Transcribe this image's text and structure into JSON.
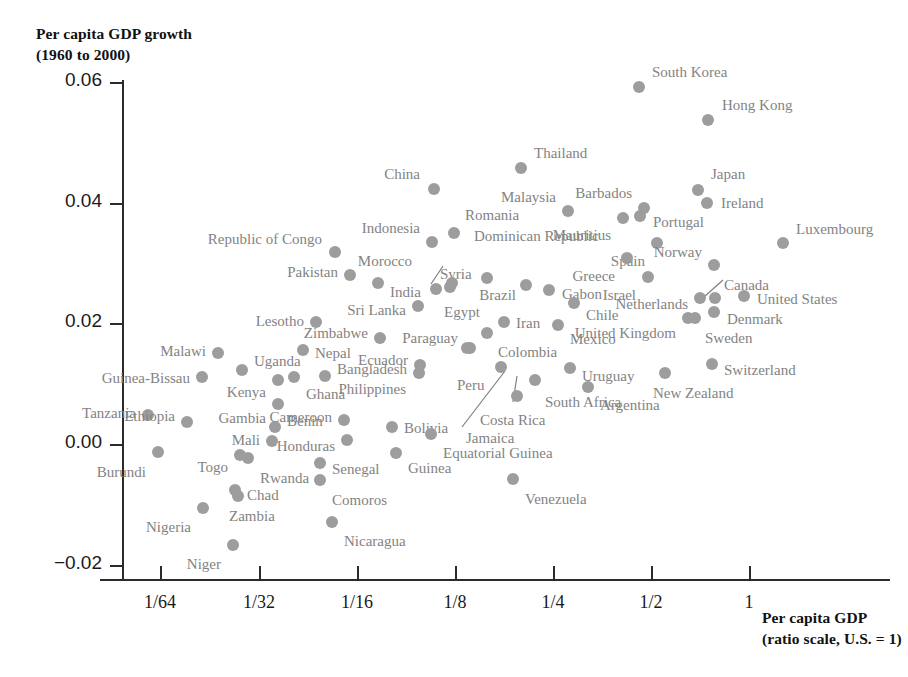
{
  "chart_data": {
    "type": "scatter",
    "title": "",
    "ylabel": "Per capita GDP growth\n(1960 to 2000)",
    "ylabel_line1": "Per capita GDP growth",
    "ylabel_line2": "(1960 to 2000)",
    "xlabel": "Per capita GDP\n(ratio scale, U.S. = 1)",
    "xlabel_line1": "Per capita GDP",
    "xlabel_line2": "(ratio scale, U.S. = 1)",
    "xscale": "log2",
    "grid": false,
    "legend": false,
    "point_color": "#9d9d9d",
    "label_color": "#838383",
    "yticks": [
      "0.06",
      "0.04",
      "0.02",
      "0.00",
      "−0.02"
    ],
    "ytick_values": [
      0.06,
      0.04,
      0.02,
      0.0,
      -0.02
    ],
    "xticks": [
      "1/64",
      "1/32",
      "1/16",
      "1/8",
      "1/4",
      "1/2",
      "1"
    ],
    "xtick_values": [
      0.015625,
      0.03125,
      0.0625,
      0.125,
      0.25,
      0.5,
      1
    ],
    "ylim": [
      -0.02,
      0.06
    ],
    "xlim_ratio": [
      0.0098,
      1.7
    ],
    "points": [
      {
        "name": "South Korea",
        "x": 0.215,
        "y": 0.0589,
        "px": 639,
        "py": 87,
        "lx": 652,
        "ly": 64,
        "align": "left"
      },
      {
        "name": "Hong Kong",
        "x": 0.425,
        "y": 0.0535,
        "px": 708,
        "py": 120,
        "lx": 722,
        "ly": 97,
        "align": "left"
      },
      {
        "name": "Thailand",
        "x": 0.119,
        "y": 0.0455,
        "px": 521,
        "py": 168,
        "lx": 534,
        "ly": 145,
        "align": "left"
      },
      {
        "name": "Japan",
        "x": 0.385,
        "y": 0.0418,
        "px": 698,
        "py": 190,
        "lx": 711,
        "ly": 166,
        "align": "left"
      },
      {
        "name": "China",
        "x": 0.0525,
        "y": 0.0421,
        "px": 434,
        "py": 189,
        "lx": 420,
        "ly": 166,
        "align": "right"
      },
      {
        "name": "Barbados",
        "x": 0.219,
        "y": 0.0392,
        "px": 644,
        "py": 208,
        "lx": 632,
        "ly": 185,
        "align": "right"
      },
      {
        "name": "Ireland",
        "x": 0.407,
        "y": 0.0396,
        "px": 707,
        "py": 203,
        "lx": 721,
        "ly": 195,
        "align": "left"
      },
      {
        "name": "Malaysia",
        "x": 0.152,
        "y": 0.0385,
        "px": 568,
        "py": 211,
        "lx": 556,
        "ly": 189,
        "align": "right"
      },
      {
        "name": "Portugal",
        "x": 0.213,
        "y": 0.0374,
        "px": 640,
        "py": 216,
        "lx": 653,
        "ly": 214,
        "align": "left"
      },
      {
        "name": "Mauritius",
        "x": 0.186,
        "y": 0.0368,
        "px": 623,
        "py": 218,
        "lx": 611,
        "ly": 227,
        "align": "right"
      },
      {
        "name": "Romania",
        "x": 0.0625,
        "y": 0.0347,
        "px": 454,
        "py": 233,
        "lx": 465,
        "ly": 207,
        "align": "left"
      },
      {
        "name": "Indonesia",
        "x": 0.0506,
        "y": 0.0333,
        "px": 432,
        "py": 242,
        "lx": 420,
        "ly": 220,
        "align": "right"
      },
      {
        "name": "Republic of Congo",
        "x": 0.0212,
        "y": 0.0318,
        "px": 335,
        "py": 252,
        "lx": 322,
        "ly": 231,
        "align": "right"
      },
      {
        "name": "Luxembourg",
        "x": 1.22,
        "y": 0.0327,
        "px": 783,
        "py": 243,
        "lx": 796,
        "ly": 221,
        "align": "left"
      },
      {
        "name": "Spain",
        "x": 0.256,
        "y": 0.0328,
        "px": 657,
        "py": 243,
        "lx": 645,
        "ly": 253,
        "align": "right"
      },
      {
        "name": "Dominican Republic",
        "x": 0.0788,
        "y": 0.0297,
        "px": 487,
        "py": 278,
        "lx": 474,
        "ly": 228,
        "align": "left"
      },
      {
        "name": "Greece",
        "x": 0.192,
        "y": 0.0284,
        "px": 627,
        "py": 258,
        "lx": 615,
        "ly": 268,
        "align": "right"
      },
      {
        "name": "Norway",
        "x": 0.423,
        "y": 0.0292,
        "px": 714,
        "py": 265,
        "lx": 702,
        "ly": 244,
        "align": "right"
      },
      {
        "name": "Pakistan",
        "x": 0.0245,
        "y": 0.0287,
        "px": 350,
        "py": 275,
        "lx": 338,
        "ly": 264,
        "align": "right"
      },
      {
        "name": "Syria",
        "x": 0.0598,
        "y": 0.0275,
        "px": 450,
        "py": 287,
        "lx": 440,
        "ly": 266,
        "align": "left"
      },
      {
        "name": "Morocco",
        "x": 0.0545,
        "y": 0.0272,
        "px": 436,
        "py": 289,
        "lx": 412,
        "ly": 253,
        "align": "right"
      },
      {
        "name": "Israel",
        "x": 0.239,
        "y": 0.0281,
        "px": 648,
        "py": 277,
        "lx": 636,
        "ly": 287,
        "align": "right"
      },
      {
        "name": "India",
        "x": 0.0312,
        "y": 0.0275,
        "px": 378,
        "py": 283,
        "lx": 390,
        "ly": 284,
        "align": "left"
      },
      {
        "name": "Egypt",
        "x": 0.0645,
        "y": 0.0273,
        "px": 452,
        "py": 283,
        "lx": 444,
        "ly": 304,
        "align": "left"
      },
      {
        "name": "Brazil",
        "x": 0.105,
        "y": 0.0268,
        "px": 526,
        "py": 285,
        "lx": 516,
        "ly": 287,
        "align": "right"
      },
      {
        "name": "Gabon",
        "x": 0.131,
        "y": 0.0259,
        "px": 549,
        "py": 290,
        "lx": 562,
        "ly": 286,
        "align": "left"
      },
      {
        "name": "Canada",
        "x": 0.425,
        "y": 0.0247,
        "px": 715,
        "py": 298,
        "lx": 724,
        "ly": 277,
        "align": "left"
      },
      {
        "name": "United States",
        "x": 0.62,
        "y": 0.0249,
        "px": 744,
        "py": 296,
        "lx": 757,
        "ly": 291,
        "align": "left"
      },
      {
        "name": "Netherlands",
        "x": 0.398,
        "y": 0.0247,
        "px": 700,
        "py": 298,
        "lx": 688,
        "ly": 296,
        "align": "right"
      },
      {
        "name": "Sri Lanka",
        "x": 0.0455,
        "y": 0.0238,
        "px": 418,
        "py": 306,
        "lx": 406,
        "ly": 302,
        "align": "right"
      },
      {
        "name": "Chile",
        "x": 0.149,
        "y": 0.0243,
        "px": 574,
        "py": 303,
        "lx": 586,
        "ly": 307,
        "align": "left"
      },
      {
        "name": "Denmark",
        "x": 0.422,
        "y": 0.0224,
        "px": 714,
        "py": 312,
        "lx": 727,
        "ly": 311,
        "align": "left"
      },
      {
        "name": "Sweden",
        "x": 0.382,
        "y": 0.0222,
        "px": 695,
        "py": 318,
        "lx": 705,
        "ly": 330,
        "align": "left"
      },
      {
        "name": "United Kingdom",
        "x": 0.372,
        "y": 0.0222,
        "px": 688,
        "py": 318,
        "lx": 676,
        "ly": 325,
        "align": "right"
      },
      {
        "name": "Iran",
        "x": 0.0905,
        "y": 0.0221,
        "px": 504,
        "py": 322,
        "lx": 516,
        "ly": 315,
        "align": "left"
      },
      {
        "name": "Lesotho",
        "x": 0.0168,
        "y": 0.0219,
        "px": 316,
        "py": 322,
        "lx": 304,
        "ly": 313,
        "align": "right"
      },
      {
        "name": "Mexico",
        "x": 0.137,
        "y": 0.0217,
        "px": 558,
        "py": 325,
        "lx": 570,
        "ly": 331,
        "align": "left"
      },
      {
        "name": "Zimbabwe",
        "x": 0.0319,
        "y": 0.0203,
        "px": 380,
        "py": 338,
        "lx": 368,
        "ly": 325,
        "align": "right"
      },
      {
        "name": "Colombia",
        "x": 0.0818,
        "y": 0.0202,
        "px": 487,
        "py": 333,
        "lx": 498,
        "ly": 344,
        "align": "left"
      },
      {
        "name": "Paraguay",
        "x": 0.0715,
        "y": 0.0193,
        "px": 470,
        "py": 348,
        "lx": 458,
        "ly": 330,
        "align": "right"
      },
      {
        "name": "Nepal",
        "x": 0.0131,
        "y": 0.0185,
        "px": 303,
        "py": 350,
        "lx": 315,
        "ly": 345,
        "align": "left"
      },
      {
        "name": "Uganda",
        "x": 0.00793,
        "y": 0.0164,
        "px": 242,
        "py": 370,
        "lx": 254,
        "ly": 353,
        "align": "left"
      },
      {
        "name": "Malawi",
        "x": 0.00648,
        "y": 0.0167,
        "px": 218,
        "py": 353,
        "lx": 206,
        "ly": 343,
        "align": "right"
      },
      {
        "name": "Ecuador",
        "x": 0.0506,
        "y": 0.0174,
        "px": 420,
        "py": 365,
        "lx": 408,
        "ly": 352,
        "align": "right"
      },
      {
        "name": "Uruguay",
        "x": 0.143,
        "y": 0.0162,
        "px": 570,
        "py": 368,
        "lx": 582,
        "ly": 368,
        "align": "left"
      },
      {
        "name": "Switzerland",
        "x": 0.42,
        "y": 0.0163,
        "px": 712,
        "py": 364,
        "lx": 724,
        "ly": 362,
        "align": "left"
      },
      {
        "name": "New Zealand",
        "x": 0.272,
        "y": 0.0158,
        "px": 665,
        "py": 373,
        "lx": 653,
        "ly": 385,
        "align": "left"
      },
      {
        "name": "Guinea-Bissau",
        "x": 0.00588,
        "y": 0.0155,
        "px": 202,
        "py": 377,
        "lx": 190,
        "ly": 370,
        "align": "right"
      },
      {
        "name": "Kenya",
        "x": 0.0115,
        "y": 0.0154,
        "px": 278,
        "py": 380,
        "lx": 266,
        "ly": 384,
        "align": "right"
      },
      {
        "name": "Ghana",
        "x": 0.0129,
        "y": 0.0157,
        "px": 294,
        "py": 377,
        "lx": 306,
        "ly": 386,
        "align": "left"
      },
      {
        "name": "Bangladesh",
        "x": 0.0197,
        "y": 0.0148,
        "px": 325,
        "py": 376,
        "lx": 337,
        "ly": 361,
        "align": "left"
      },
      {
        "name": "Philippines",
        "x": 0.0478,
        "y": 0.0141,
        "px": 419,
        "py": 373,
        "lx": 406,
        "ly": 381,
        "align": "right"
      },
      {
        "name": "Peru",
        "x": 0.0717,
        "y": 0.0145,
        "px": 467,
        "py": 348,
        "lx": 457,
        "ly": 377,
        "align": "left"
      },
      {
        "name": "Jamaica",
        "x": 0.0855,
        "y": 0.0126,
        "px": 501,
        "py": 367,
        "lx": 466,
        "ly": 430,
        "align": "left"
      },
      {
        "name": "Costa Rica",
        "x": 0.108,
        "y": 0.0125,
        "px": 517,
        "py": 396,
        "lx": 480,
        "ly": 412,
        "align": "left"
      },
      {
        "name": "Tanzania",
        "x": 0.00389,
        "y": 0.0104,
        "px": 148,
        "py": 415,
        "lx": 136,
        "ly": 405,
        "align": "right"
      },
      {
        "name": "Ethiopia",
        "x": 0.00646,
        "y": 0.01,
        "px": 187,
        "py": 422,
        "lx": 175,
        "ly": 408,
        "align": "right"
      },
      {
        "name": "Gambia",
        "x": 0.0114,
        "y": 0.0113,
        "px": 278,
        "py": 404,
        "lx": 266,
        "ly": 410,
        "align": "right"
      },
      {
        "name": "Benin",
        "x": 0.011,
        "y": 0.009,
        "px": 275,
        "py": 427,
        "lx": 287,
        "ly": 413,
        "align": "left"
      },
      {
        "name": "Cameroon",
        "x": 0.0201,
        "y": 0.0093,
        "px": 344,
        "py": 420,
        "lx": 332,
        "ly": 409,
        "align": "right"
      },
      {
        "name": "South Africa",
        "x": 0.112,
        "y": 0.0084,
        "px": 535,
        "py": 380,
        "lx": 545,
        "ly": 394,
        "align": "left"
      },
      {
        "name": "Argentina",
        "x": 0.158,
        "y": 0.0086,
        "px": 588,
        "py": 387,
        "lx": 600,
        "ly": 397,
        "align": "left"
      },
      {
        "name": "Bolivia",
        "x": 0.041,
        "y": 0.0069,
        "px": 392,
        "py": 427,
        "lx": 404,
        "ly": 420,
        "align": "left"
      },
      {
        "name": "Honduras",
        "x": 0.0206,
        "y": 0.0053,
        "px": 347,
        "py": 440,
        "lx": 335,
        "ly": 438,
        "align": "right"
      },
      {
        "name": "Mali",
        "x": 0.0112,
        "y": 0.0043,
        "px": 272,
        "py": 441,
        "lx": 260,
        "ly": 432,
        "align": "right"
      },
      {
        "name": "Equatorial Guinea",
        "x": 0.0555,
        "y": 0.0044,
        "px": 431,
        "py": 434,
        "lx": 443,
        "ly": 445,
        "align": "left"
      },
      {
        "name": "Guinea",
        "x": 0.043,
        "y": 0.0028,
        "px": 396,
        "py": 453,
        "lx": 408,
        "ly": 460,
        "align": "left"
      },
      {
        "name": "Togo",
        "x": 0.00878,
        "y": 0.0005,
        "px": 240,
        "py": 455,
        "lx": 228,
        "ly": 459,
        "align": "right"
      },
      {
        "name": "Rwanda",
        "x": 0.0094,
        "y": 0.0003,
        "px": 248,
        "py": 458,
        "lx": 260,
        "ly": 470,
        "align": "left"
      },
      {
        "name": "Burundi",
        "x": 0.00441,
        "y": -0.001,
        "px": 158,
        "py": 452,
        "lx": 146,
        "ly": 464,
        "align": "right"
      },
      {
        "name": "Senegal",
        "x": 0.0174,
        "y": -0.0002,
        "px": 320,
        "py": 463,
        "lx": 332,
        "ly": 461,
        "align": "left"
      },
      {
        "name": "Comoros",
        "x": 0.0174,
        "y": -0.0022,
        "px": 320,
        "py": 480,
        "lx": 332,
        "ly": 492,
        "align": "left"
      },
      {
        "name": "Venezuela",
        "x": 0.096,
        "y": -0.005,
        "px": 513,
        "py": 479,
        "lx": 525,
        "ly": 491,
        "align": "left"
      },
      {
        "name": "Chad",
        "x": 0.00812,
        "y": -0.007,
        "px": 235,
        "py": 490,
        "lx": 247,
        "ly": 487,
        "align": "left"
      },
      {
        "name": "Zambia",
        "x": 0.0083,
        "y": -0.0078,
        "px": 238,
        "py": 496,
        "lx": 229,
        "ly": 508,
        "align": "left"
      },
      {
        "name": "Nigeria",
        "x": 0.00591,
        "y": -0.0094,
        "px": 203,
        "py": 508,
        "lx": 191,
        "ly": 519,
        "align": "right"
      },
      {
        "name": "Nicaragua",
        "x": 0.0193,
        "y": -0.0114,
        "px": 332,
        "py": 522,
        "lx": 344,
        "ly": 533,
        "align": "left"
      },
      {
        "name": "Niger",
        "x": 0.008,
        "y": -0.0157,
        "px": 233,
        "py": 545,
        "lx": 221,
        "ly": 556,
        "align": "right"
      }
    ],
    "leader_lines": [
      {
        "name": "morocco-leader",
        "x1": 443,
        "y1": 266,
        "x2": 431,
        "y2": 284
      },
      {
        "name": "jamaica-leader",
        "x1": 462,
        "y1": 427,
        "x2": 505,
        "y2": 371
      },
      {
        "name": "costa-rica-leader",
        "x1": 513,
        "y1": 402,
        "x2": 517,
        "y2": 376
      },
      {
        "name": "canada-leader",
        "x1": 723,
        "y1": 280,
        "x2": 704,
        "y2": 297
      }
    ]
  }
}
